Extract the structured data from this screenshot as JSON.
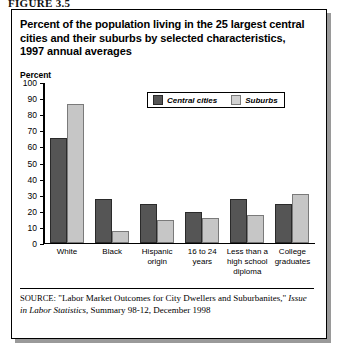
{
  "figure": {
    "label": "FIGURE 3.5",
    "title": "Percent of the population living in the 25 largest central cities and their suburbs by selected characteristics, 1997 annual averages"
  },
  "legend": {
    "items": [
      {
        "label": "Central cities",
        "color": "#555555"
      },
      {
        "label": "Suburbs",
        "color": "#c6c6c6"
      }
    ]
  },
  "source": {
    "prefix": "SOURCE",
    "quoted_title": "\"Labor Market Outcomes for City Dwellers and Suburbanites,\"",
    "publication": "Issue in Labor Statistics",
    "tail": ", Summary 98-12, December 1998"
  },
  "chart_data": {
    "type": "bar",
    "title": "Percent of the population living in the 25 largest central cities and their suburbs by selected characteristics, 1997 annual averages",
    "xlabel": "",
    "ylabel": "Percent",
    "ylim": [
      0,
      100
    ],
    "ytick_step": 10,
    "yticks": [
      100,
      90,
      80,
      70,
      60,
      50,
      40,
      30,
      20,
      10,
      0
    ],
    "grid": false,
    "legend_position": "top-right-inside",
    "categories": [
      "White",
      "Black",
      "Hispanic origin",
      "16 to 24 years",
      "Less than a high school diploma",
      "College graduates"
    ],
    "series": [
      {
        "name": "Central cities",
        "color": "#555555",
        "values": [
          65,
          27,
          24,
          19,
          27,
          24
        ]
      },
      {
        "name": "Suburbs",
        "color": "#c6c6c6",
        "values": [
          86,
          7,
          14,
          15,
          17,
          30
        ]
      }
    ]
  }
}
